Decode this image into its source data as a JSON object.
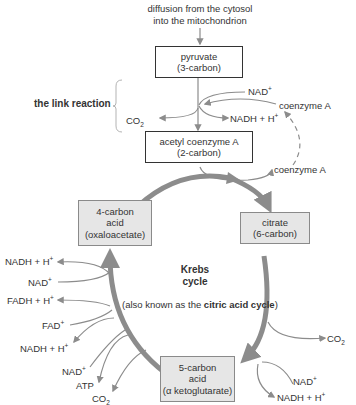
{
  "header": {
    "line1": "diffusion from the cytosol",
    "line2": "into the mitochondrion"
  },
  "boxes": {
    "pyruvate": {
      "name": "pyruvate",
      "detail": "(3-carbon)"
    },
    "acetyl_coa": {
      "name": "acetyl coenzyme A",
      "detail": "(2-carbon)"
    },
    "oxaloacetate": {
      "line1": "4-carbon",
      "line2": "acid",
      "line3": "(oxaloacetate)"
    },
    "citrate": {
      "name": "citrate",
      "detail": "(6-carbon)"
    },
    "ketoglutarate": {
      "line1": "5-carbon",
      "line2": "acid",
      "line3": "(α ketoglutarate)"
    }
  },
  "link_reaction": {
    "label": "the link reaction",
    "nad_in": "NAD",
    "nadh_out": "NADH + H",
    "co2": "CO",
    "coenzyme_a_in": "coenzyme A",
    "coenzyme_a_out": "coenzyme A"
  },
  "center": {
    "title1": "Krebs",
    "title2": "cycle",
    "note_prefix": "(also known as the ",
    "note_bold": "citric acid cycle",
    "note_suffix": ")"
  },
  "left_side": {
    "nadh_1": "NADH + H",
    "nad_1": "NAD",
    "fadh": "FADH + H",
    "fad": "FAD",
    "nadh_2": "NADH + H",
    "nad_2": "NAD",
    "atp": "ATP",
    "co2": "CO"
  },
  "right_side": {
    "co2": "CO",
    "nad": "NAD",
    "nadh": "NADH + H"
  },
  "symbols": {
    "plus": "+",
    "two": "2"
  },
  "colors": {
    "arrow": "#8c8c8c",
    "cycle": "#8c8c8c",
    "box_border": "#333333",
    "grey_box": "#e6e6e6"
  }
}
